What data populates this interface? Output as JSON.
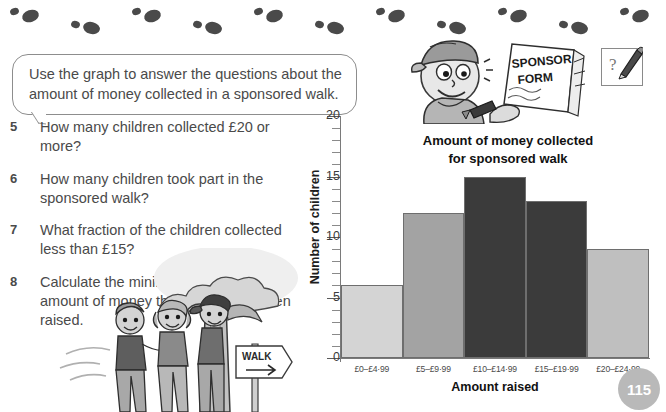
{
  "page": {
    "number": "115",
    "instruction": "Use the graph to answer the questions about the amount of money collected in a sponsored walk."
  },
  "questions": [
    {
      "number": "5",
      "text": "How many children collected £20 or more?"
    },
    {
      "number": "6",
      "text": "How many children took part in the sponsored walk?"
    },
    {
      "number": "7",
      "text": "What fraction of the children collected less than £15?"
    },
    {
      "number": "8",
      "text": "Calculate the minimum and maximum amount of money that could have been raised."
    }
  ],
  "illustrations": {
    "sponsor_form_label_line1": "SPONSOR",
    "sponsor_form_label_line2": "FORM",
    "question_box_mark": "?",
    "walk_sign_label": "WALK"
  },
  "chart_data": {
    "type": "bar",
    "title": "Amount of money collected for sponsored walk",
    "title_line1": "Amount of money collected",
    "title_line2": "for sponsored walk",
    "xlabel": "Amount raised",
    "ylabel": "Number of children",
    "categories": [
      "£0–£4·99",
      "£5–£9·99",
      "£10–£14·99",
      "£15–£19·99",
      "£20–£24·99"
    ],
    "values": [
      6,
      12,
      15,
      13,
      9
    ],
    "ylim": [
      0,
      20
    ],
    "ytick_labels": [
      "0",
      "5",
      "10",
      "15",
      "20"
    ],
    "ytick_values": [
      0,
      5,
      10,
      15,
      20
    ],
    "minor_tick_step": 1,
    "grid": false,
    "legend": false,
    "bar_colors": [
      "#d4d4d4",
      "#a3a3a3",
      "#3b3b3b",
      "#3b3b3b",
      "#bfbfbf"
    ]
  },
  "colors": {
    "axis": "#7a7a7a",
    "text": "#4a4a4a",
    "title": "#111111",
    "page_badge": "#b9b9b9"
  }
}
